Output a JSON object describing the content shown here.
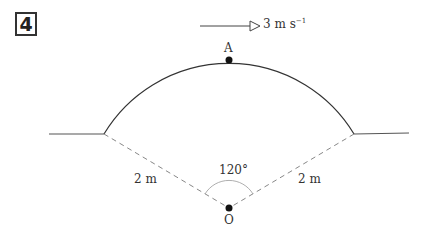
{
  "question_number": "4",
  "velocity": {
    "value_text": "3 m s",
    "exponent": "−1",
    "direction": "right"
  },
  "points": {
    "top": "A",
    "centre": "O"
  },
  "labels": {
    "radius_left": "2 m",
    "radius_right": "2 m",
    "angle": "120°"
  },
  "colors": {
    "line": "#444444",
    "dashed": "#888888",
    "dot": "#111111"
  }
}
